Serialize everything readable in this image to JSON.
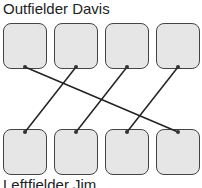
{
  "top_group": {
    "label": "Outfielder Davis",
    "boxes": [
      {
        "id": "top-1"
      },
      {
        "id": "top-2"
      },
      {
        "id": "top-3"
      },
      {
        "id": "top-4"
      }
    ]
  },
  "bottom_group": {
    "label": "Leftfielder Jim",
    "boxes": [
      {
        "id": "bottom-1"
      },
      {
        "id": "bottom-2"
      },
      {
        "id": "bottom-3"
      },
      {
        "id": "bottom-4"
      }
    ]
  },
  "connections": [
    {
      "from": "top-1",
      "to": "bottom-4"
    },
    {
      "from": "top-2",
      "to": "bottom-1"
    },
    {
      "from": "top-3",
      "to": "bottom-2"
    },
    {
      "from": "top-4",
      "to": "bottom-3"
    }
  ],
  "colors": {
    "box_fill": "#e6e6e6",
    "box_border": "#444444",
    "line": "#222222"
  }
}
